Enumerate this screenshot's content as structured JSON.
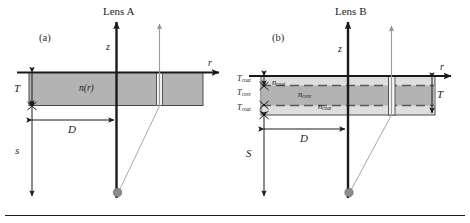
{
  "figure": {
    "panels": [
      {
        "tag": "(a)",
        "title": "Lens A",
        "axis_z": "z",
        "axis_r": "r",
        "material_label": "n(r)",
        "thickness_label": "T",
        "diameter_label": "D",
        "distance_label": "s"
      },
      {
        "tag": "(b)",
        "title": "Lens B",
        "axis_z": "z",
        "axis_r": "r",
        "thickness_label": "T",
        "diameter_label": "D",
        "distance_label": "S",
        "layer_labels": {
          "coat_top": {
            "base": "n",
            "sub": "coat"
          },
          "core": {
            "base": "n",
            "sub": "core"
          },
          "coat_bottom": {
            "base": "n",
            "sub": "coat"
          }
        },
        "thickness_stack": [
          {
            "base": "T",
            "sub": "coat"
          },
          {
            "base": "T",
            "sub": "core"
          },
          {
            "base": "T",
            "sub": "coat"
          }
        ]
      }
    ],
    "colors": {
      "slab_uniform": "#b3b3b3",
      "slab_coat": "#dedede",
      "slab_core": "#b3b3b3",
      "axis": "#1a1a1a",
      "ray": "#9a9a9a",
      "source_dot": "#8c8c8c",
      "outline": "#4a4a4a",
      "background": "#ffffff"
    }
  }
}
